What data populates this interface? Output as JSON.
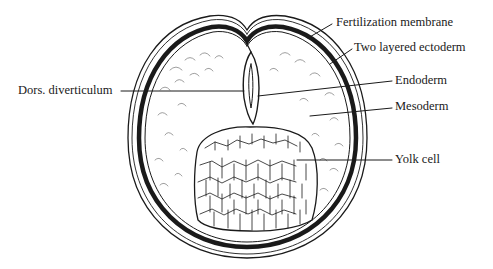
{
  "diagram": {
    "type": "biological cross-section",
    "colors": {
      "ink": "#1a1a1a",
      "background": "#ffffff"
    }
  },
  "labels": {
    "fertilization_membrane": "Fertilization membrane",
    "two_layered_ectoderm": "Two layered ectoderm",
    "endoderm": "Endoderm",
    "mesoderm": "Mesoderm",
    "yolk_cell": "Yolk cell",
    "dors_diverticulum": "Dors. diverticulum"
  }
}
